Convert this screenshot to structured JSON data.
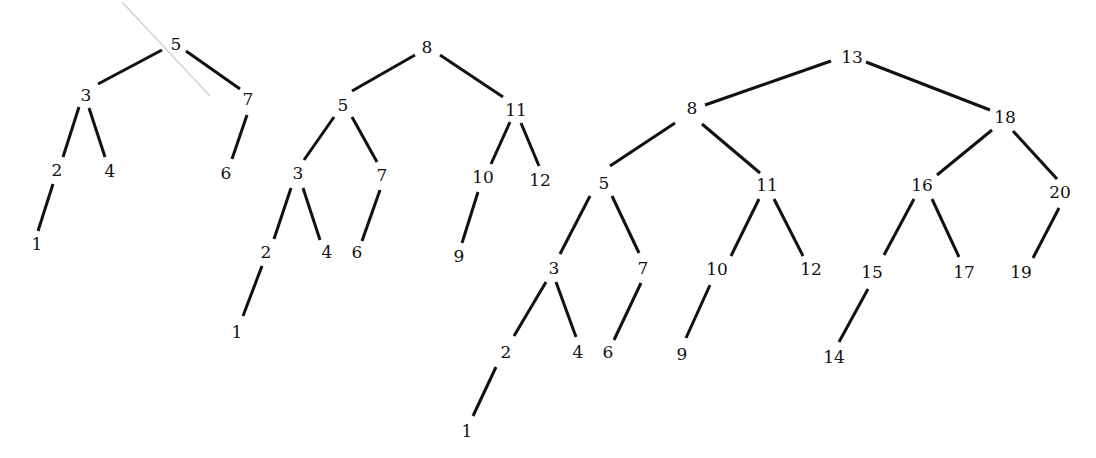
{
  "trees": [
    {
      "name": "tree-height-3",
      "nodes": [
        {
          "id": "a5",
          "label": "5",
          "x": 176,
          "y": 45
        },
        {
          "id": "a3",
          "label": "3",
          "x": 86,
          "y": 96
        },
        {
          "id": "a7",
          "label": "7",
          "x": 248,
          "y": 100
        },
        {
          "id": "a2",
          "label": "2",
          "x": 57,
          "y": 171
        },
        {
          "id": "a4",
          "label": "4",
          "x": 110,
          "y": 172
        },
        {
          "id": "a6",
          "label": "6",
          "x": 226,
          "y": 174
        },
        {
          "id": "a1",
          "label": "1",
          "x": 37,
          "y": 245
        }
      ],
      "edges": [
        {
          "x1": 162,
          "y1": 50,
          "x2": 98,
          "y2": 84
        },
        {
          "x1": 186,
          "y1": 51,
          "x2": 240,
          "y2": 89
        },
        {
          "x1": 79,
          "y1": 107,
          "x2": 63,
          "y2": 157
        },
        {
          "x1": 89,
          "y1": 108,
          "x2": 105,
          "y2": 157
        },
        {
          "x1": 247,
          "y1": 115,
          "x2": 232,
          "y2": 159
        },
        {
          "x1": 53,
          "y1": 184,
          "x2": 38,
          "y2": 231
        }
      ]
    },
    {
      "name": "tree-height-4",
      "nodes": [
        {
          "id": "b8",
          "label": "8",
          "x": 427,
          "y": 48
        },
        {
          "id": "b5",
          "label": "5",
          "x": 343,
          "y": 106
        },
        {
          "id": "b11",
          "label": "11",
          "x": 516,
          "y": 111
        },
        {
          "id": "b3",
          "label": "3",
          "x": 298,
          "y": 174
        },
        {
          "id": "b7",
          "label": "7",
          "x": 382,
          "y": 176
        },
        {
          "id": "b10",
          "label": "10",
          "x": 483,
          "y": 178
        },
        {
          "id": "b12",
          "label": "12",
          "x": 540,
          "y": 181
        },
        {
          "id": "b2",
          "label": "2",
          "x": 266,
          "y": 253
        },
        {
          "id": "b4",
          "label": "4",
          "x": 327,
          "y": 253
        },
        {
          "id": "b6",
          "label": "6",
          "x": 357,
          "y": 253
        },
        {
          "id": "b9",
          "label": "9",
          "x": 459,
          "y": 257
        },
        {
          "id": "b1",
          "label": "1",
          "x": 237,
          "y": 333
        }
      ],
      "edges": [
        {
          "x1": 415,
          "y1": 55,
          "x2": 352,
          "y2": 91
        },
        {
          "x1": 440,
          "y1": 55,
          "x2": 503,
          "y2": 97
        },
        {
          "x1": 334,
          "y1": 117,
          "x2": 304,
          "y2": 160
        },
        {
          "x1": 352,
          "y1": 117,
          "x2": 377,
          "y2": 162
        },
        {
          "x1": 510,
          "y1": 122,
          "x2": 491,
          "y2": 164
        },
        {
          "x1": 521,
          "y1": 123,
          "x2": 539,
          "y2": 166
        },
        {
          "x1": 291,
          "y1": 188,
          "x2": 274,
          "y2": 239
        },
        {
          "x1": 303,
          "y1": 188,
          "x2": 320,
          "y2": 240
        },
        {
          "x1": 380,
          "y1": 190,
          "x2": 362,
          "y2": 241
        },
        {
          "x1": 478,
          "y1": 192,
          "x2": 462,
          "y2": 243
        },
        {
          "x1": 262,
          "y1": 266,
          "x2": 243,
          "y2": 316
        }
      ]
    },
    {
      "name": "tree-height-5",
      "nodes": [
        {
          "id": "c13",
          "label": "13",
          "x": 852,
          "y": 58
        },
        {
          "id": "c8",
          "label": "8",
          "x": 692,
          "y": 109
        },
        {
          "id": "c18",
          "label": "18",
          "x": 1005,
          "y": 118
        },
        {
          "id": "c5",
          "label": "5",
          "x": 604,
          "y": 184
        },
        {
          "id": "c11",
          "label": "11",
          "x": 767,
          "y": 186
        },
        {
          "id": "c16",
          "label": "16",
          "x": 922,
          "y": 186
        },
        {
          "id": "c20",
          "label": "20",
          "x": 1060,
          "y": 193
        },
        {
          "id": "c3",
          "label": "3",
          "x": 554,
          "y": 269
        },
        {
          "id": "c7",
          "label": "7",
          "x": 643,
          "y": 269
        },
        {
          "id": "c10",
          "label": "10",
          "x": 717,
          "y": 270
        },
        {
          "id": "c12",
          "label": "12",
          "x": 811,
          "y": 270
        },
        {
          "id": "c15",
          "label": "15",
          "x": 872,
          "y": 273
        },
        {
          "id": "c17",
          "label": "17",
          "x": 964,
          "y": 273
        },
        {
          "id": "c19",
          "label": "19",
          "x": 1021,
          "y": 273
        },
        {
          "id": "c2",
          "label": "2",
          "x": 506,
          "y": 353
        },
        {
          "id": "c4",
          "label": "4",
          "x": 578,
          "y": 353
        },
        {
          "id": "c6",
          "label": "6",
          "x": 608,
          "y": 353
        },
        {
          "id": "c9",
          "label": "9",
          "x": 682,
          "y": 355
        },
        {
          "id": "c14",
          "label": "14",
          "x": 834,
          "y": 358
        },
        {
          "id": "c1",
          "label": "1",
          "x": 467,
          "y": 432
        }
      ],
      "edges": [
        {
          "x1": 831,
          "y1": 61,
          "x2": 705,
          "y2": 105
        },
        {
          "x1": 866,
          "y1": 62,
          "x2": 990,
          "y2": 110
        },
        {
          "x1": 675,
          "y1": 123,
          "x2": 610,
          "y2": 166
        },
        {
          "x1": 702,
          "y1": 124,
          "x2": 760,
          "y2": 173
        },
        {
          "x1": 992,
          "y1": 130,
          "x2": 937,
          "y2": 175
        },
        {
          "x1": 1013,
          "y1": 131,
          "x2": 1057,
          "y2": 179
        },
        {
          "x1": 590,
          "y1": 196,
          "x2": 560,
          "y2": 254
        },
        {
          "x1": 612,
          "y1": 196,
          "x2": 639,
          "y2": 253
        },
        {
          "x1": 759,
          "y1": 199,
          "x2": 731,
          "y2": 256
        },
        {
          "x1": 774,
          "y1": 199,
          "x2": 803,
          "y2": 256
        },
        {
          "x1": 914,
          "y1": 199,
          "x2": 884,
          "y2": 255
        },
        {
          "x1": 932,
          "y1": 199,
          "x2": 959,
          "y2": 257
        },
        {
          "x1": 1059,
          "y1": 208,
          "x2": 1033,
          "y2": 258
        },
        {
          "x1": 546,
          "y1": 282,
          "x2": 514,
          "y2": 336
        },
        {
          "x1": 556,
          "y1": 282,
          "x2": 576,
          "y2": 337
        },
        {
          "x1": 641,
          "y1": 283,
          "x2": 614,
          "y2": 340
        },
        {
          "x1": 710,
          "y1": 285,
          "x2": 686,
          "y2": 338
        },
        {
          "x1": 868,
          "y1": 289,
          "x2": 839,
          "y2": 342
        },
        {
          "x1": 496,
          "y1": 367,
          "x2": 473,
          "y2": 416
        }
      ]
    }
  ],
  "stray_line": {
    "x1": 122,
    "y1": 2,
    "x2": 210,
    "y2": 96
  }
}
